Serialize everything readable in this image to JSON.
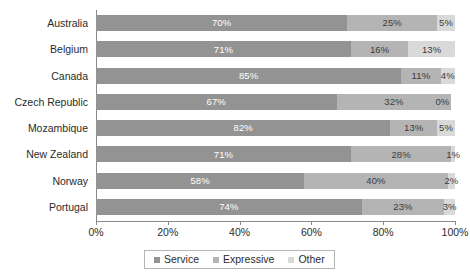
{
  "chart_data": {
    "type": "bar",
    "orientation": "horizontal",
    "stacked": true,
    "stack_total": 100,
    "title": "",
    "subtitle": "",
    "xlabel": "",
    "ylabel": "",
    "xlim": [
      0,
      100
    ],
    "xticks": [
      "0%",
      "20%",
      "40%",
      "60%",
      "80%",
      "100%"
    ],
    "xtick_values": [
      0,
      20,
      40,
      60,
      80,
      100
    ],
    "grid": false,
    "legend_position": "bottom",
    "categories": [
      "Australia",
      "Belgium",
      "Canada",
      "Czech Republic",
      "Mozambique",
      "New Zealand",
      "Norway",
      "Portugal"
    ],
    "series": [
      {
        "name": "Service",
        "color": "#939393",
        "values": [
          70,
          71,
          85,
          67,
          82,
          71,
          58,
          74
        ],
        "labels": [
          "70%",
          "71%",
          "85%",
          "67%",
          "82%",
          "71%",
          "58%",
          "74%"
        ]
      },
      {
        "name": "Expressive",
        "color": "#b4b4b4",
        "values": [
          25,
          16,
          11,
          32,
          13,
          28,
          40,
          23
        ],
        "labels": [
          "25%",
          "16%",
          "11%",
          "32%",
          "13%",
          "28%",
          "40%",
          "23%"
        ]
      },
      {
        "name": "Other",
        "color": "#d9d9d9",
        "values": [
          5,
          13,
          4,
          0,
          5,
          1,
          2,
          3
        ],
        "labels": [
          "5%",
          "13%",
          "4%",
          "0%",
          "5%",
          "1%",
          "2%",
          "3%"
        ]
      }
    ]
  },
  "legend": {
    "items": [
      {
        "label": "Service"
      },
      {
        "label": "Expressive"
      },
      {
        "label": "Other"
      }
    ]
  },
  "axis": {
    "x_ticks": [
      {
        "label": "0%"
      },
      {
        "label": "20%"
      },
      {
        "label": "40%"
      },
      {
        "label": "60%"
      },
      {
        "label": "80%"
      },
      {
        "label": "100%"
      }
    ]
  },
  "colors": {
    "service": "#939393",
    "expressive": "#b4b4b4",
    "other": "#d9d9d9",
    "axis": "#8a8a8a",
    "text": "#2b2b2b",
    "label_on_dark": "#ffffff",
    "background": "#ffffff"
  }
}
